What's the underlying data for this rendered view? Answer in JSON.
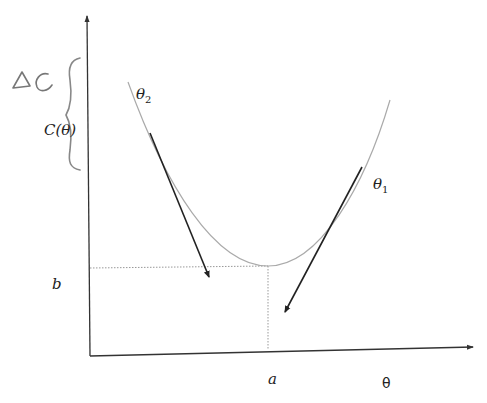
{
  "diagram": {
    "type": "gradient-descent-cost-curve",
    "colors": {
      "axis": "#333333",
      "curve": "#aaaaaa",
      "arrow": "#222222",
      "guide": "#999999",
      "handwriting": "#777777"
    },
    "labels": {
      "y_axis": "C(θ)",
      "x_axis": "θ",
      "min_x": "a",
      "min_y": "b",
      "theta_1": "θ",
      "theta_1_sub": "1",
      "theta_2": "θ",
      "theta_2_sub": "2",
      "delta_c": "ΔC"
    },
    "points": {
      "minimum": {
        "label_x": "a",
        "label_y": "b"
      },
      "theta_1": {
        "side": "right",
        "tangent_direction": "down-left"
      },
      "theta_2": {
        "side": "left",
        "tangent_direction": "down-right"
      }
    }
  }
}
